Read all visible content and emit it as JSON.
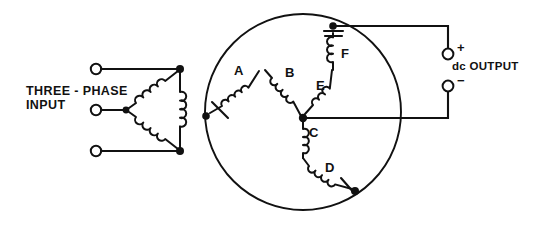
{
  "diagram": {
    "title_caption": {
      "line1": "THREE - PHASE",
      "line2": "INPUT"
    },
    "output_label": "dc OUTPUT",
    "terminals": {
      "positive_sign": "+",
      "negative_sign": "−"
    },
    "winding_labels": [
      {
        "id": "A",
        "text": "A"
      },
      {
        "id": "B",
        "text": "B"
      },
      {
        "id": "C",
        "text": "C"
      },
      {
        "id": "D",
        "text": "D"
      },
      {
        "id": "E",
        "text": "E"
      },
      {
        "id": "F",
        "text": "F"
      }
    ],
    "colors": {
      "ink": "#111111",
      "paper": "#ffffff"
    }
  }
}
